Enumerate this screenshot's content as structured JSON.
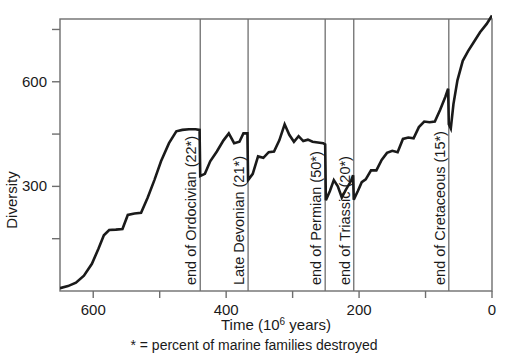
{
  "chart_data": {
    "type": "line",
    "title": "",
    "xlabel": "Time (10^6 years)",
    "xlabel_main": "Time (10",
    "xlabel_sup": "6",
    "xlabel_tail": " years)",
    "ylabel": "Diversity",
    "caption": "* = percent of marine families destroyed",
    "xlim": [
      650,
      0
    ],
    "ylim": [
      0,
      780
    ],
    "x_ticks": [
      600,
      500,
      400,
      300,
      200,
      100,
      0
    ],
    "x_tick_labels": [
      "600",
      "",
      "400",
      "",
      "200",
      "",
      "0"
    ],
    "y_ticks": [
      150,
      300,
      450,
      600,
      750
    ],
    "y_tick_labels": [
      "",
      "300",
      "",
      "600",
      ""
    ],
    "grid": false,
    "legend": "none",
    "line_color": "#1a1a1a",
    "frame_color": "#6e6e6e",
    "events": [
      {
        "name": "end of Ordocivian (22*)",
        "x": 439,
        "percent": 22
      },
      {
        "name": "Late Devonian (21*)",
        "x": 367,
        "percent": 21
      },
      {
        "name": "end of Permian (50*)",
        "x": 251,
        "percent": 50
      },
      {
        "name": "end of Triassic (20*)",
        "x": 208,
        "percent": 20
      },
      {
        "name": "end of Cretaceous (15*)",
        "x": 65,
        "percent": 15
      }
    ],
    "series": [
      {
        "name": "Marine family diversity",
        "points": [
          [
            650,
            8
          ],
          [
            638,
            14
          ],
          [
            626,
            24
          ],
          [
            614,
            44
          ],
          [
            602,
            78
          ],
          [
            592,
            122
          ],
          [
            584,
            160
          ],
          [
            576,
            175
          ],
          [
            566,
            176
          ],
          [
            556,
            178
          ],
          [
            548,
            218
          ],
          [
            538,
            222
          ],
          [
            528,
            224
          ],
          [
            518,
            268
          ],
          [
            508,
            318
          ],
          [
            498,
            372
          ],
          [
            486,
            424
          ],
          [
            475,
            458
          ],
          [
            466,
            462
          ],
          [
            456,
            464
          ],
          [
            446,
            464
          ],
          [
            440,
            462
          ],
          [
            439,
            330
          ],
          [
            432,
            336
          ],
          [
            424,
            372
          ],
          [
            414,
            400
          ],
          [
            404,
            432
          ],
          [
            396,
            452
          ],
          [
            388,
            424
          ],
          [
            380,
            428
          ],
          [
            374,
            452
          ],
          [
            368,
            452
          ],
          [
            367,
            318
          ],
          [
            360,
            336
          ],
          [
            352,
            386
          ],
          [
            344,
            382
          ],
          [
            336,
            398
          ],
          [
            328,
            400
          ],
          [
            320,
            432
          ],
          [
            312,
            478
          ],
          [
            305,
            448
          ],
          [
            298,
            428
          ],
          [
            291,
            444
          ],
          [
            284,
            430
          ],
          [
            277,
            434
          ],
          [
            270,
            428
          ],
          [
            262,
            426
          ],
          [
            254,
            424
          ],
          [
            251,
            420
          ],
          [
            250,
            260
          ],
          [
            244,
            286
          ],
          [
            238,
            318
          ],
          [
            232,
            300
          ],
          [
            226,
            268
          ],
          [
            220,
            290
          ],
          [
            212,
            316
          ],
          [
            209,
            332
          ],
          [
            208,
            262
          ],
          [
            202,
            286
          ],
          [
            196,
            312
          ],
          [
            190,
            320
          ],
          [
            182,
            346
          ],
          [
            174,
            346
          ],
          [
            166,
            376
          ],
          [
            158,
            396
          ],
          [
            150,
            402
          ],
          [
            142,
            398
          ],
          [
            134,
            436
          ],
          [
            126,
            440
          ],
          [
            118,
            438
          ],
          [
            110,
            470
          ],
          [
            102,
            486
          ],
          [
            94,
            484
          ],
          [
            86,
            486
          ],
          [
            78,
            520
          ],
          [
            70,
            558
          ],
          [
            66,
            580
          ],
          [
            65,
            478
          ],
          [
            62,
            466
          ],
          [
            58,
            536
          ],
          [
            52,
            604
          ],
          [
            44,
            660
          ],
          [
            36,
            688
          ],
          [
            28,
            712
          ],
          [
            18,
            742
          ],
          [
            8,
            766
          ],
          [
            0,
            790
          ]
        ]
      }
    ]
  },
  "layout": {
    "plot_left": 60,
    "plot_right": 492,
    "plot_top": 19,
    "plot_bottom": 291
  }
}
